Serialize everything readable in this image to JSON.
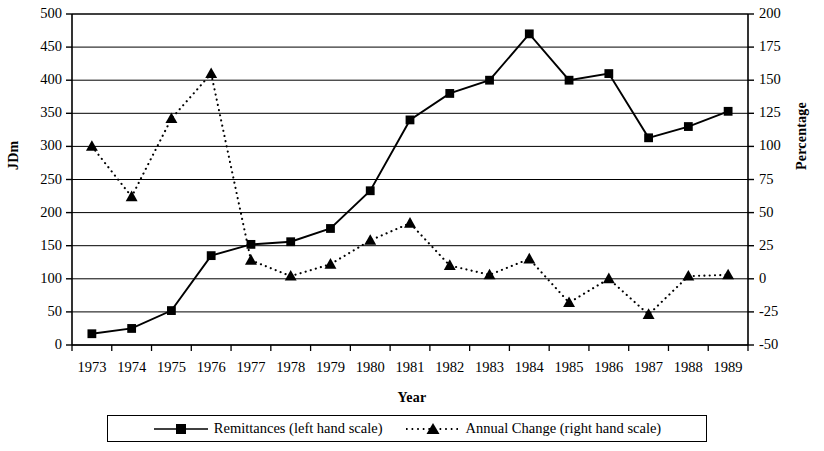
{
  "chart_data": {
    "type": "line",
    "title": "",
    "xlabel": "Year",
    "ylabel": "JDm",
    "ylabel_secondary": "Percentage",
    "categories": [
      "1973",
      "1974",
      "1975",
      "1976",
      "1977",
      "1978",
      "1979",
      "1980",
      "1981",
      "1982",
      "1983",
      "1984",
      "1985",
      "1986",
      "1987",
      "1988",
      "1989"
    ],
    "ylim": [
      0,
      500
    ],
    "ytick_step": 50,
    "yticks": [
      "0",
      "50",
      "100",
      "150",
      "200",
      "250",
      "300",
      "350",
      "400",
      "450",
      "500"
    ],
    "ylim_secondary": [
      -50,
      200
    ],
    "ytick_step_secondary": 25,
    "yticks_secondary": [
      "-50",
      "-25",
      "0",
      "25",
      "50",
      "75",
      "100",
      "125",
      "150",
      "175",
      "200"
    ],
    "grid": true,
    "grid_axis": "y",
    "legend_position": "bottom",
    "series": [
      {
        "name": "Remittances (left hand scale)",
        "axis": "left",
        "marker": "square",
        "line_style": "solid",
        "color": "#000000",
        "values": [
          17,
          25,
          52,
          135,
          152,
          156,
          176,
          233,
          340,
          380,
          400,
          470,
          400,
          410,
          313,
          330,
          353
        ]
      },
      {
        "name": "Annual Change (right hand scale)",
        "axis": "right",
        "marker": "triangle",
        "line_style": "dotted",
        "color": "#000000",
        "values": [
          100,
          62,
          121,
          155,
          14,
          2,
          11,
          29,
          42,
          10,
          3,
          15,
          -18,
          0,
          -27,
          2,
          3
        ]
      }
    ]
  },
  "legend": {
    "items": [
      {
        "label": "Remittances (left hand scale)",
        "marker": "square",
        "line_style": "solid"
      },
      {
        "label": "Annual Change (right hand scale)",
        "marker": "triangle",
        "line_style": "dotted"
      }
    ]
  },
  "colors": {
    "line": "#000000",
    "grid": "#000000",
    "axis": "#000000",
    "background": "#ffffff"
  }
}
